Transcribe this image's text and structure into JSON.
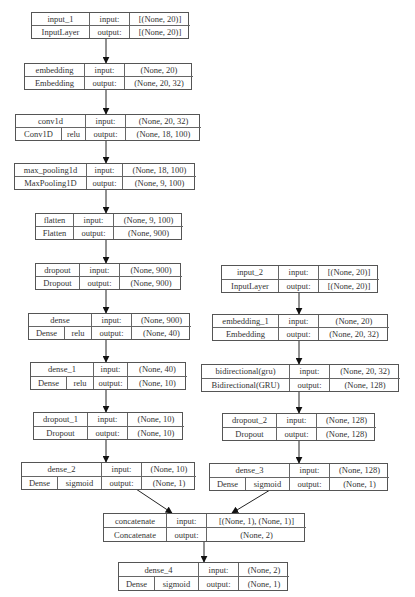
{
  "diagram": {
    "title": "",
    "nodes": [
      {
        "id": "input_1",
        "name": "input_1",
        "type": "InputLayer",
        "activation": "",
        "input_label": "input:",
        "output_label": "output:",
        "input": "[(None, 20)]",
        "output": "[(None, 20)]"
      },
      {
        "id": "embedding",
        "name": "embedding",
        "type": "Embedding",
        "activation": "",
        "input_label": "input:",
        "output_label": "output:",
        "input": "(None, 20)",
        "output": "(None, 20, 32)"
      },
      {
        "id": "conv1d",
        "name": "conv1d",
        "type": "Conv1D",
        "activation": "relu",
        "input_label": "input:",
        "output_label": "output:",
        "input": "(None, 20, 32)",
        "output": "(None, 18, 100)"
      },
      {
        "id": "max_pooling1d",
        "name": "max_pooling1d",
        "type": "MaxPooling1D",
        "activation": "",
        "input_label": "input:",
        "output_label": "output:",
        "input": "(None, 18, 100)",
        "output": "(None, 9, 100)"
      },
      {
        "id": "flatten",
        "name": "flatten",
        "type": "Flatten",
        "activation": "",
        "input_label": "input:",
        "output_label": "output:",
        "input": "(None, 9, 100)",
        "output": "(None, 900)"
      },
      {
        "id": "dropout",
        "name": "dropout",
        "type": "Dropout",
        "activation": "",
        "input_label": "input:",
        "output_label": "output:",
        "input": "(None, 900)",
        "output": "(None, 900)"
      },
      {
        "id": "dense",
        "name": "dense",
        "type": "Dense",
        "activation": "relu",
        "input_label": "input:",
        "output_label": "output:",
        "input": "(None, 900)",
        "output": "(None, 40)"
      },
      {
        "id": "dense_1",
        "name": "dense_1",
        "type": "Dense",
        "activation": "relu",
        "input_label": "input:",
        "output_label": "output:",
        "input": "(None, 40)",
        "output": "(None, 10)"
      },
      {
        "id": "dropout_1",
        "name": "dropout_1",
        "type": "Dropout",
        "activation": "",
        "input_label": "input:",
        "output_label": "output:",
        "input": "(None, 10)",
        "output": "(None, 10)"
      },
      {
        "id": "dense_2",
        "name": "dense_2",
        "type": "Dense",
        "activation": "sigmoid",
        "input_label": "input:",
        "output_label": "output:",
        "input": "(None, 10)",
        "output": "(None, 1)"
      },
      {
        "id": "input_2",
        "name": "input_2",
        "type": "InputLayer",
        "activation": "",
        "input_label": "input:",
        "output_label": "output:",
        "input": "[(None, 20)]",
        "output": "[(None, 20)]"
      },
      {
        "id": "embedding_1",
        "name": "embedding_1",
        "type": "Embedding",
        "activation": "",
        "input_label": "input:",
        "output_label": "output:",
        "input": "(None, 20)",
        "output": "(None, 20, 32)"
      },
      {
        "id": "bidirectional",
        "name": "bidirectional(gru)",
        "type": "Bidirectional(GRU)",
        "activation": "",
        "input_label": "input:",
        "output_label": "output:",
        "input": "(None, 20, 32)",
        "output": "(None, 128)"
      },
      {
        "id": "dropout_2",
        "name": "dropout_2",
        "type": "Dropout",
        "activation": "",
        "input_label": "input:",
        "output_label": "output:",
        "input": "(None, 128)",
        "output": "(None, 128)"
      },
      {
        "id": "dense_3",
        "name": "dense_3",
        "type": "Dense",
        "activation": "sigmoid",
        "input_label": "input:",
        "output_label": "output:",
        "input": "(None, 128)",
        "output": "(None, 1)"
      },
      {
        "id": "concatenate",
        "name": "concatenate",
        "type": "Concatenate",
        "activation": "",
        "input_label": "input:",
        "output_label": "output:",
        "input": "[(None, 1), (None, 1)]",
        "output": "(None, 2)"
      },
      {
        "id": "dense_4",
        "name": "dense_4",
        "type": "Dense",
        "activation": "sigmoid",
        "input_label": "input:",
        "output_label": "output:",
        "input": "(None, 2)",
        "output": "(None, 1)"
      }
    ],
    "edges": [
      [
        "input_1",
        "embedding"
      ],
      [
        "embedding",
        "conv1d"
      ],
      [
        "conv1d",
        "max_pooling1d"
      ],
      [
        "max_pooling1d",
        "flatten"
      ],
      [
        "flatten",
        "dropout"
      ],
      [
        "dropout",
        "dense"
      ],
      [
        "dense",
        "dense_1"
      ],
      [
        "dense_1",
        "dropout_1"
      ],
      [
        "dropout_1",
        "dense_2"
      ],
      [
        "input_2",
        "embedding_1"
      ],
      [
        "embedding_1",
        "bidirectional"
      ],
      [
        "bidirectional",
        "dropout_2"
      ],
      [
        "dropout_2",
        "dense_3"
      ],
      [
        "dense_2",
        "concatenate"
      ],
      [
        "dense_3",
        "concatenate"
      ],
      [
        "concatenate",
        "dense_4"
      ]
    ]
  }
}
